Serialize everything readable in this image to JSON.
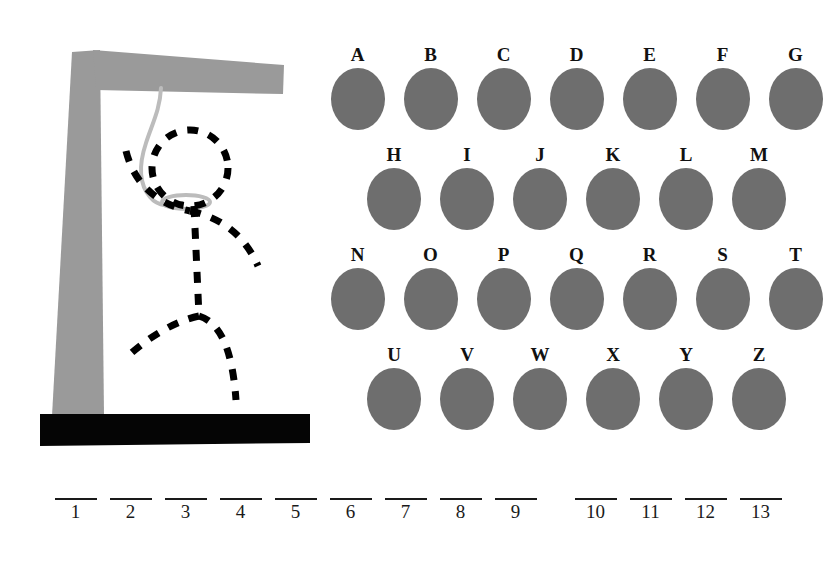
{
  "game": {
    "title": "Hangman",
    "colors": {
      "gallows": "#999999",
      "gallows_base": "#000000",
      "rope": "#b8b8b8",
      "figure": "#000000",
      "letter_disc": "#6e6e6e",
      "text": "#111111",
      "background": "#ffffff"
    }
  },
  "gallows": {
    "post_name": "gallows-post",
    "beam_name": "gallows-beam",
    "base_name": "gallows-base",
    "rope_name": "hangman-rope",
    "figure_parts": [
      "head",
      "left-arm",
      "right-arm",
      "torso",
      "left-leg",
      "right-leg"
    ],
    "figure_style": "dashed",
    "wrong_guesses_drawn": 6
  },
  "keyboard": {
    "rows": [
      {
        "id": "row-1",
        "keys": [
          {
            "letter": "A",
            "used": false
          },
          {
            "letter": "B",
            "used": false
          },
          {
            "letter": "C",
            "used": false
          },
          {
            "letter": "D",
            "used": false
          },
          {
            "letter": "E",
            "used": false
          },
          {
            "letter": "F",
            "used": false
          },
          {
            "letter": "G",
            "used": false
          }
        ]
      },
      {
        "id": "row-2",
        "keys": [
          {
            "letter": "H",
            "used": false
          },
          {
            "letter": "I",
            "used": false
          },
          {
            "letter": "J",
            "used": false
          },
          {
            "letter": "K",
            "used": false
          },
          {
            "letter": "L",
            "used": false
          },
          {
            "letter": "M",
            "used": false
          }
        ]
      },
      {
        "id": "row-3",
        "keys": [
          {
            "letter": "N",
            "used": false
          },
          {
            "letter": "O",
            "used": false
          },
          {
            "letter": "P",
            "used": false
          },
          {
            "letter": "Q",
            "used": false
          },
          {
            "letter": "R",
            "used": false
          },
          {
            "letter": "S",
            "used": false
          },
          {
            "letter": "T",
            "used": false
          }
        ]
      },
      {
        "id": "row-4",
        "keys": [
          {
            "letter": "U",
            "used": false
          },
          {
            "letter": "V",
            "used": false
          },
          {
            "letter": "W",
            "used": false
          },
          {
            "letter": "X",
            "used": false
          },
          {
            "letter": "Y",
            "used": false
          },
          {
            "letter": "Z",
            "used": false
          }
        ]
      }
    ]
  },
  "answer": {
    "total_slots": 13,
    "words": [
      {
        "slots": [
          {
            "number": "1",
            "letter": ""
          },
          {
            "number": "2",
            "letter": ""
          },
          {
            "number": "3",
            "letter": ""
          },
          {
            "number": "4",
            "letter": ""
          },
          {
            "number": "5",
            "letter": ""
          },
          {
            "number": "6",
            "letter": ""
          },
          {
            "number": "7",
            "letter": ""
          },
          {
            "number": "8",
            "letter": ""
          },
          {
            "number": "9",
            "letter": ""
          }
        ]
      },
      {
        "slots": [
          {
            "number": "10",
            "letter": ""
          },
          {
            "number": "11",
            "letter": ""
          },
          {
            "number": "12",
            "letter": ""
          },
          {
            "number": "13",
            "letter": ""
          }
        ]
      }
    ]
  }
}
